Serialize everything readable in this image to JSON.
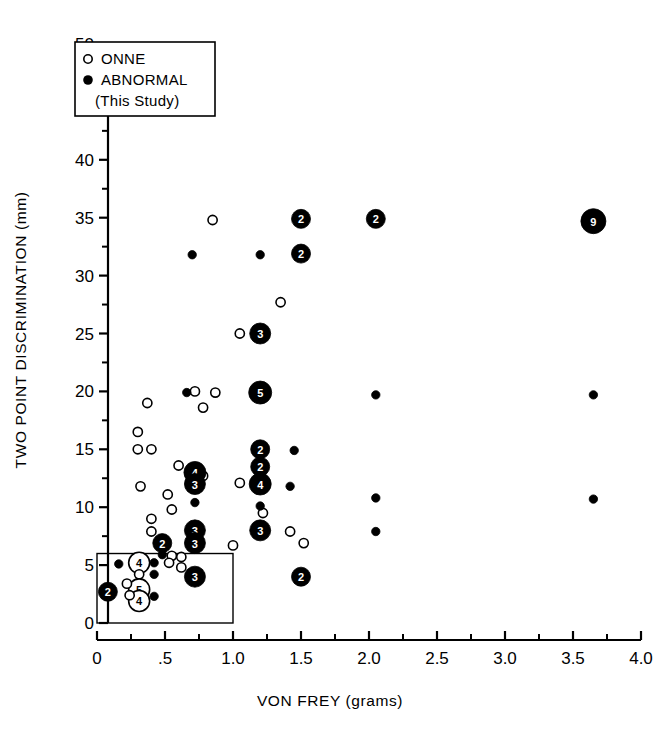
{
  "chart_data": {
    "type": "scatter",
    "title": "",
    "xlabel": "VON FREY (grams)",
    "ylabel": "TWO POINT DISCRIMINATION (mm)",
    "xlim": [
      0,
      4.0
    ],
    "ylim": [
      0,
      50
    ],
    "xticks": [
      "0",
      ".5",
      "1.0",
      "1.5",
      "2.0",
      "2.5",
      "3.0",
      "3.5",
      "4.0"
    ],
    "xtick_values": [
      0,
      0.5,
      1.0,
      1.5,
      2.0,
      2.5,
      3.0,
      3.5,
      4.0
    ],
    "x_minor_step": 0.25,
    "yticks": [
      "0",
      "5",
      "10",
      "15",
      "20",
      "25",
      "30",
      "35",
      "40",
      "45",
      "50"
    ],
    "ytick_values": [
      0,
      5,
      10,
      15,
      20,
      25,
      30,
      35,
      40,
      45,
      50
    ],
    "y_minor_step": 2.5,
    "grid": false,
    "legend_position": "top-left",
    "legend": [
      {
        "key": "onne",
        "label": "ONNE",
        "marker": "open-circle"
      },
      {
        "key": "abnormal",
        "label": "ABNORMAL",
        "marker": "filled-circle"
      },
      {
        "key": "abnormal_sub",
        "label": "(This Study)",
        "marker": "none"
      }
    ],
    "annotations": [
      {
        "name": "normal-range-box",
        "type": "rect",
        "x0": 0,
        "y0": 0,
        "x1": 1.0,
        "y1": 6.0
      }
    ],
    "series": [
      {
        "name": "ONNE",
        "marker": "open-circle",
        "points": [
          {
            "x": 0.85,
            "y": 34.8,
            "n": 1
          },
          {
            "x": 1.35,
            "y": 27.7,
            "n": 1
          },
          {
            "x": 1.05,
            "y": 25.0,
            "n": 1
          },
          {
            "x": 0.72,
            "y": 20.0,
            "n": 1
          },
          {
            "x": 0.87,
            "y": 19.9,
            "n": 1
          },
          {
            "x": 0.78,
            "y": 18.6,
            "n": 1
          },
          {
            "x": 0.37,
            "y": 19.0,
            "n": 1
          },
          {
            "x": 0.3,
            "y": 16.5,
            "n": 1
          },
          {
            "x": 0.3,
            "y": 15.0,
            "n": 1
          },
          {
            "x": 0.4,
            "y": 15.0,
            "n": 1
          },
          {
            "x": 0.6,
            "y": 13.6,
            "n": 1
          },
          {
            "x": 0.78,
            "y": 12.7,
            "n": 1
          },
          {
            "x": 0.32,
            "y": 11.8,
            "n": 1
          },
          {
            "x": 0.52,
            "y": 11.1,
            "n": 1
          },
          {
            "x": 0.55,
            "y": 9.8,
            "n": 1
          },
          {
            "x": 1.05,
            "y": 12.1,
            "n": 1
          },
          {
            "x": 1.22,
            "y": 9.5,
            "n": 1
          },
          {
            "x": 0.4,
            "y": 9.0,
            "n": 1
          },
          {
            "x": 0.4,
            "y": 7.9,
            "n": 1
          },
          {
            "x": 1.42,
            "y": 7.9,
            "n": 1
          },
          {
            "x": 1.52,
            "y": 6.9,
            "n": 1
          },
          {
            "x": 1.0,
            "y": 6.7,
            "n": 1
          },
          {
            "x": 0.55,
            "y": 5.8,
            "n": 1
          },
          {
            "x": 0.62,
            "y": 5.7,
            "n": 1
          },
          {
            "x": 0.53,
            "y": 5.2,
            "n": 1
          },
          {
            "x": 0.62,
            "y": 4.8,
            "n": 1
          },
          {
            "x": 0.31,
            "y": 5.2,
            "n": 4
          },
          {
            "x": 0.31,
            "y": 4.2,
            "n": 1
          },
          {
            "x": 0.31,
            "y": 2.9,
            "n": 5
          },
          {
            "x": 0.31,
            "y": 1.9,
            "n": 4
          },
          {
            "x": 0.22,
            "y": 3.4,
            "n": 1
          },
          {
            "x": 0.24,
            "y": 2.4,
            "n": 1
          }
        ]
      },
      {
        "name": "ABNORMAL (This Study)",
        "marker": "filled-circle",
        "points": [
          {
            "x": 1.5,
            "y": 34.9,
            "n": 2
          },
          {
            "x": 2.05,
            "y": 34.9,
            "n": 2
          },
          {
            "x": 3.65,
            "y": 34.7,
            "n": 9
          },
          {
            "x": 1.5,
            "y": 31.9,
            "n": 2
          },
          {
            "x": 0.7,
            "y": 31.8,
            "n": 1
          },
          {
            "x": 1.2,
            "y": 31.8,
            "n": 1
          },
          {
            "x": 1.2,
            "y": 25.0,
            "n": 3
          },
          {
            "x": 1.2,
            "y": 19.9,
            "n": 5
          },
          {
            "x": 0.66,
            "y": 19.9,
            "n": 1
          },
          {
            "x": 2.05,
            "y": 19.7,
            "n": 1
          },
          {
            "x": 3.65,
            "y": 19.7,
            "n": 1
          },
          {
            "x": 1.2,
            "y": 15.0,
            "n": 2
          },
          {
            "x": 1.45,
            "y": 14.9,
            "n": 1
          },
          {
            "x": 1.2,
            "y": 13.5,
            "n": 2
          },
          {
            "x": 0.72,
            "y": 13.0,
            "n": 4
          },
          {
            "x": 1.2,
            "y": 12.0,
            "n": 4
          },
          {
            "x": 0.72,
            "y": 12.0,
            "n": 3
          },
          {
            "x": 1.42,
            "y": 11.8,
            "n": 1
          },
          {
            "x": 2.05,
            "y": 10.8,
            "n": 1
          },
          {
            "x": 3.65,
            "y": 10.7,
            "n": 1
          },
          {
            "x": 0.72,
            "y": 10.4,
            "n": 1
          },
          {
            "x": 1.2,
            "y": 10.1,
            "n": 1
          },
          {
            "x": 0.72,
            "y": 8.0,
            "n": 3
          },
          {
            "x": 1.2,
            "y": 8.0,
            "n": 3
          },
          {
            "x": 0.72,
            "y": 6.9,
            "n": 3
          },
          {
            "x": 0.48,
            "y": 6.9,
            "n": 2
          },
          {
            "x": 2.05,
            "y": 7.9,
            "n": 1
          },
          {
            "x": 0.72,
            "y": 4.0,
            "n": 3
          },
          {
            "x": 1.5,
            "y": 4.0,
            "n": 2
          },
          {
            "x": 0.08,
            "y": 2.7,
            "n": 2
          },
          {
            "x": 0.16,
            "y": 5.1,
            "n": 1
          },
          {
            "x": 0.42,
            "y": 5.2,
            "n": 1
          },
          {
            "x": 0.42,
            "y": 4.2,
            "n": 1
          },
          {
            "x": 0.42,
            "y": 2.3,
            "n": 1
          },
          {
            "x": 0.48,
            "y": 5.9,
            "n": 1
          }
        ]
      }
    ]
  }
}
